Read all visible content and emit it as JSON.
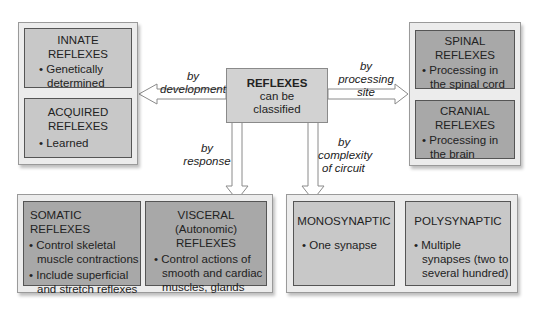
{
  "center": {
    "title": "REFLEXES",
    "line1": "can be",
    "line2": "classified"
  },
  "labels": {
    "development": {
      "l1": "by",
      "l2": "development"
    },
    "processing": {
      "l1": "by",
      "l2": "processing",
      "l3": "site"
    },
    "response": {
      "l1": "by",
      "l2": "response"
    },
    "complexity": {
      "l1": "by",
      "l2": "complexity",
      "l3": "of circuit"
    }
  },
  "development_group": {
    "innate": {
      "title1": "INNATE",
      "title2": "REFLEXES",
      "bullet": "• Genetically determined"
    },
    "acquired": {
      "title1": "ACQUIRED",
      "title2": "REFLEXES",
      "bullet": "• Learned"
    }
  },
  "processing_group": {
    "spinal": {
      "title1": "SPINAL",
      "title2": "REFLEXES",
      "bullet": "• Processing in the spinal cord"
    },
    "cranial": {
      "title1": "CRANIAL",
      "title2": "REFLEXES",
      "bullet": "• Processing in the brain"
    }
  },
  "response_group": {
    "somatic": {
      "title": "SOMATIC REFLEXES",
      "bullet1": "• Control skeletal muscle contractions",
      "bullet2": "• Include superficial and stretch reflexes"
    },
    "visceral": {
      "title1": "VISCERAL (Autonomic)",
      "title2": "REFLEXES",
      "bullet": "• Control actions of smooth and cardiac muscles, glands"
    }
  },
  "complexity_group": {
    "mono": {
      "title": "MONOSYNAPTIC",
      "bullet": "• One synapse"
    },
    "poly": {
      "title": "POLYSYNAPTIC",
      "bullet": "• Multiple synapses (two to several hundred)"
    }
  },
  "colors": {
    "light_box": "#c8c8c8",
    "dark_box": "#a8a8a8",
    "panel": "#ececec"
  }
}
